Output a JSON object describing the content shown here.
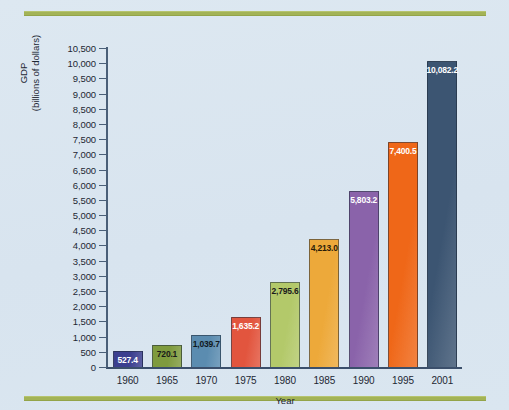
{
  "figure": {
    "background_color": "#dce7f0",
    "rule_color": "#a3b356"
  },
  "chart_data": {
    "type": "bar",
    "title": "",
    "xlabel": "Year",
    "ylabel_line1": "GDP",
    "ylabel_line2": "(billions of dollars)",
    "categories": [
      "1960",
      "1965",
      "1970",
      "1975",
      "1980",
      "1985",
      "1990",
      "1995",
      "2001"
    ],
    "values": [
      527.4,
      720.1,
      1039.7,
      1635.2,
      2795.6,
      4213.0,
      5803.2,
      7400.5,
      10082.2
    ],
    "value_labels": [
      "527.4",
      "720.1",
      "1,039.7",
      "1,635.2",
      "2,795.6",
      "4,213.0",
      "5,803.2",
      "7,400.5",
      "10,082.2"
    ],
    "bar_colors": [
      "#3b3f8f",
      "#7f9b3e",
      "#5b8cb0",
      "#e2553e",
      "#b3c96a",
      "#eda93a",
      "#8a63aa",
      "#ef6718",
      "#3c5572"
    ],
    "label_text_colors": [
      "#ffffff",
      "#1a1a1a",
      "#101820",
      "#ffffff",
      "#1a1a1a",
      "#2a1c08",
      "#ffffff",
      "#ffffff",
      "#ffffff"
    ],
    "ylim": [
      0,
      10500
    ],
    "ytick_step": 500,
    "ytick_labels": [
      "0",
      "500",
      "1,000",
      "1,500",
      "2,000",
      "2,500",
      "3,000",
      "3,500",
      "4,000",
      "4,500",
      "5,000",
      "5,500",
      "6,000",
      "6,500",
      "7,000",
      "7,500",
      "8,000",
      "8,500",
      "9,000",
      "9,500",
      "10,000",
      "10,500"
    ],
    "grid": "off",
    "legend": "none"
  }
}
